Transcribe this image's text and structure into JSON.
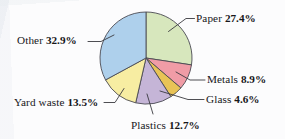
{
  "chart_data": {
    "type": "pie",
    "title": "",
    "subtitle": "",
    "xlabel": "",
    "ylabel": "",
    "legend_position": "none",
    "grid": false,
    "units": "percent",
    "total": 100,
    "start_angle_deg": 0,
    "direction": "clockwise",
    "categories": [
      "Paper",
      "Metals",
      "Glass",
      "Plastics",
      "Yard waste",
      "Other"
    ],
    "values": [
      27.4,
      8.9,
      4.6,
      12.7,
      13.5,
      32.9
    ],
    "slices": [
      {
        "name": "Paper",
        "label": "Paper",
        "value": 27.4,
        "value_text": "27.4%",
        "color": "#d7e7bd"
      },
      {
        "name": "Metals",
        "label": "Metals",
        "value": 8.9,
        "value_text": "8.9%",
        "color": "#f09ca6"
      },
      {
        "name": "Glass",
        "label": "Glass",
        "value": 4.6,
        "value_text": "4.6%",
        "color": "#e8c356"
      },
      {
        "name": "Plastics",
        "label": "Plastics",
        "value": 12.7,
        "value_text": "12.7%",
        "color": "#c5b5d7"
      },
      {
        "name": "Yard waste",
        "label": "Yard waste",
        "value": 13.5,
        "value_text": "13.5%",
        "color": "#f7eda2"
      },
      {
        "name": "Other",
        "label": "Other",
        "value": 32.9,
        "value_text": "32.9%",
        "color": "#aed0ec"
      }
    ],
    "colors": {
      "paper": "#d7e7bd",
      "metals": "#f09ca6",
      "glass": "#e8c356",
      "plastics": "#c5b5d7",
      "yard_waste": "#f7eda2",
      "other": "#aed0ec",
      "outline": "#4a4a52",
      "leader_line": "#3a3a40",
      "text": "#17171a",
      "background": "#fcfcfd"
    },
    "geometry": {
      "center_x": 146,
      "center_y": 58,
      "radius": 46
    }
  },
  "labels": {
    "paper": {
      "name": "Paper",
      "value": "27.4%"
    },
    "metals": {
      "name": "Metals",
      "value": "8.9%"
    },
    "glass": {
      "name": "Glass",
      "value": "4.6%"
    },
    "plastics": {
      "name": "Plastics",
      "value": "12.7%"
    },
    "yard_waste": {
      "name": "Yard waste",
      "value": "13.5%"
    },
    "other": {
      "name": "Other",
      "value": "32.9%"
    }
  }
}
